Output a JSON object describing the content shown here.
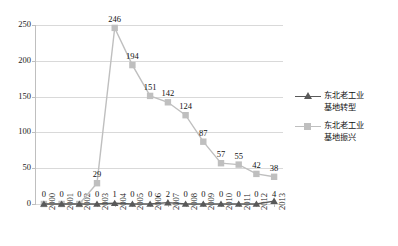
{
  "chart_data": {
    "type": "line",
    "title": "",
    "xlabel": "",
    "ylabel": "",
    "categories": [
      "2000",
      "2001",
      "2002",
      "2003",
      "2004",
      "2005",
      "2006",
      "2007",
      "2008",
      "2009",
      "2010",
      "2011",
      "2012",
      "2013"
    ],
    "series": [
      {
        "name": "东北老工业基地转型",
        "marker": "triangle",
        "color": "#595959",
        "values": [
          0,
          0,
          0,
          0,
          1,
          0,
          0,
          2,
          0,
          0,
          0,
          0,
          0,
          4
        ]
      },
      {
        "name": "东北老工业基地振兴",
        "marker": "square",
        "color": "#bfbfbf",
        "values": [
          0,
          0,
          0,
          29,
          246,
          194,
          151,
          142,
          124,
          87,
          57,
          55,
          42,
          38
        ]
      }
    ],
    "ylim": [
      0,
      250
    ],
    "yticks": [
      "0",
      "50",
      "100",
      "150",
      "200",
      "250"
    ],
    "grid": "horizontal",
    "legend_position": "right"
  },
  "colors": {
    "series_transform": "#595959",
    "series_revival": "#bfbfbf",
    "gridline": "#d9d9d9",
    "axis": "#bfbfbf",
    "text": "#1a1a1a",
    "background": "#ffffff"
  }
}
